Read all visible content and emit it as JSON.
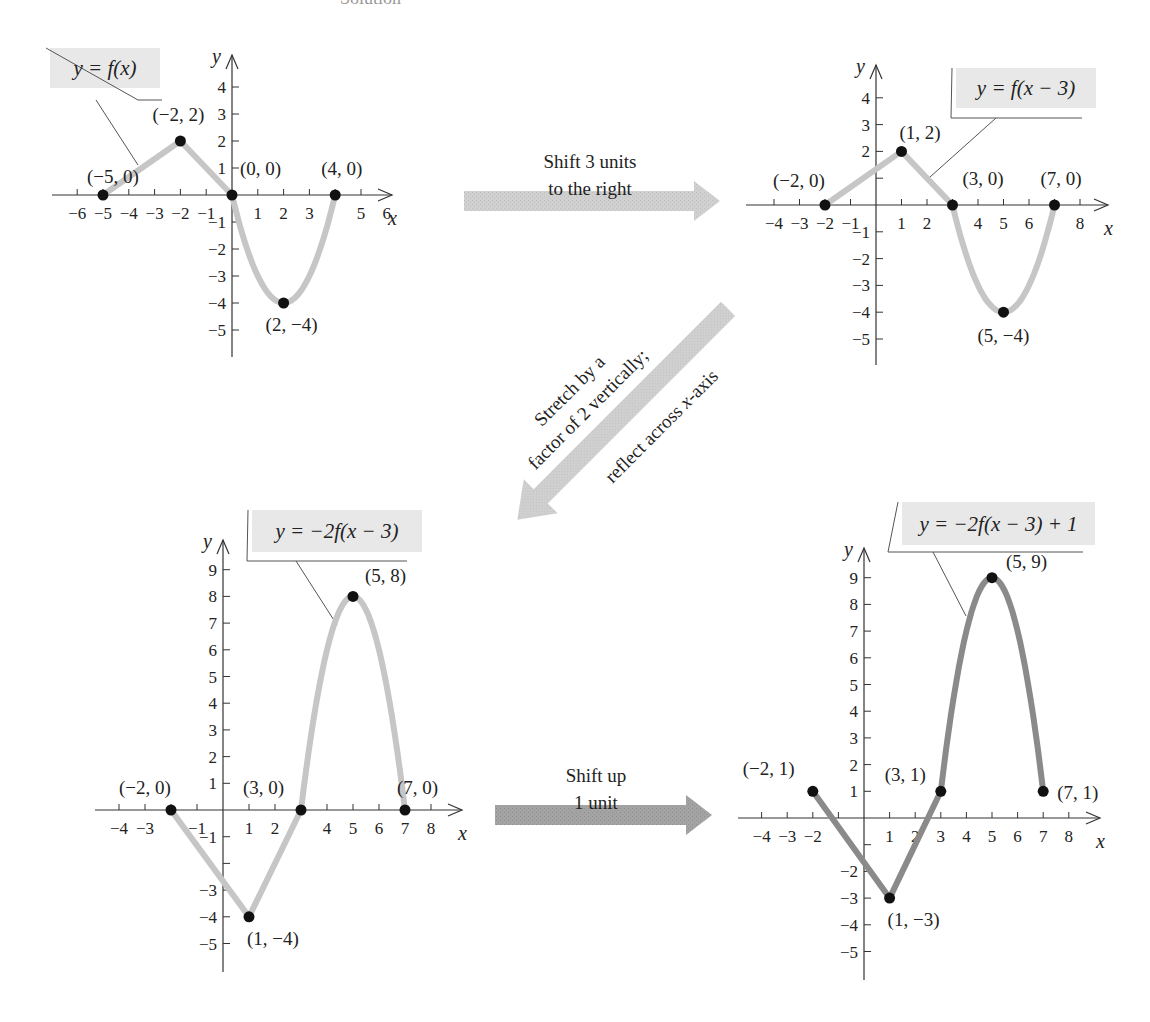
{
  "header_fragment": "Solution",
  "colors": {
    "curve_light": "#c6c6c6",
    "curve_dark": "#8a8a8a",
    "point": "#111111",
    "label_box": "#e8e8e8",
    "arrow_light": "#cfcfcf",
    "arrow_dark": "#9a9a9a"
  },
  "arrows": [
    {
      "id": "shift-right",
      "lines": [
        "Shift 3 units",
        "to the right"
      ]
    },
    {
      "id": "stretch-reflect",
      "lines": [
        "Stretch by a",
        "factor of 2 vertically;",
        "reflect across x-axis"
      ]
    },
    {
      "id": "shift-up",
      "lines": [
        "Shift up",
        "1 unit"
      ]
    }
  ],
  "chart_data": [
    {
      "type": "line",
      "title": "y = f(x)",
      "xlabel": "x",
      "ylabel": "y",
      "xlim": [
        -6.5,
        7
      ],
      "ylim": [
        -6,
        5
      ],
      "x_ticks": [
        "-6",
        "-5",
        "-4",
        "-3",
        "-2",
        "-1",
        "1",
        "2",
        "3",
        "5",
        "6"
      ],
      "y_ticks": [
        "4",
        "3",
        "2",
        "1",
        "-1",
        "-2",
        "-3",
        "-4",
        "-5"
      ],
      "points": [
        {
          "x": -5,
          "y": 0,
          "label": "(−5, 0)"
        },
        {
          "x": -2,
          "y": 2,
          "label": "(−2, 2)"
        },
        {
          "x": 0,
          "y": 0,
          "label": "(0, 0)"
        },
        {
          "x": 2,
          "y": -4,
          "label": "(2, −4)"
        },
        {
          "x": 4,
          "y": 0,
          "label": "(4, 0)"
        }
      ],
      "grid": false
    },
    {
      "type": "line",
      "title": "y = f(x − 3)",
      "xlabel": "x",
      "ylabel": "y",
      "xlim": [
        -5,
        9
      ],
      "ylim": [
        -6,
        5
      ],
      "x_ticks": [
        "-4",
        "-3",
        "-2",
        "-1",
        "1",
        "2",
        "4",
        "5",
        "6",
        "8"
      ],
      "y_ticks": [
        "4",
        "3",
        "2",
        "-1",
        "-2",
        "-3",
        "-4",
        "-5"
      ],
      "points": [
        {
          "x": -2,
          "y": 0,
          "label": "(−2, 0)"
        },
        {
          "x": 1,
          "y": 2,
          "label": "(1, 2)"
        },
        {
          "x": 3,
          "y": 0,
          "label": "(3, 0)"
        },
        {
          "x": 5,
          "y": -4,
          "label": "(5, −4)"
        },
        {
          "x": 7,
          "y": 0,
          "label": "(7, 0)"
        }
      ],
      "grid": false
    },
    {
      "type": "line",
      "title": "y = −2f(x − 3)",
      "xlabel": "x",
      "ylabel": "y",
      "xlim": [
        -5,
        9
      ],
      "ylim": [
        -6,
        10
      ],
      "x_ticks": [
        "-4",
        "-3",
        "-1",
        "1",
        "2",
        "4",
        "5",
        "6",
        "7",
        "8"
      ],
      "y_ticks": [
        "9",
        "8",
        "7",
        "6",
        "5",
        "4",
        "3",
        "2",
        "1",
        "-1",
        "-3",
        "-4",
        "-5"
      ],
      "points": [
        {
          "x": -2,
          "y": 0,
          "label": "(−2, 0)"
        },
        {
          "x": 1,
          "y": -4,
          "label": "(1, −4)"
        },
        {
          "x": 3,
          "y": 0,
          "label": "(3, 0)"
        },
        {
          "x": 5,
          "y": 8,
          "label": "(5, 8)"
        },
        {
          "x": 7,
          "y": 0,
          "label": "(7, 0)"
        }
      ],
      "grid": false
    },
    {
      "type": "line",
      "title": "y = −2f(x − 3) + 1",
      "xlabel": "x",
      "ylabel": "y",
      "xlim": [
        -5,
        9
      ],
      "ylim": [
        -6,
        10
      ],
      "x_ticks": [
        "-4",
        "-3",
        "-2",
        "1",
        "2",
        "3",
        "4",
        "5",
        "6",
        "7",
        "8"
      ],
      "y_ticks": [
        "9",
        "8",
        "7",
        "6",
        "5",
        "4",
        "3",
        "2",
        "1",
        "-2",
        "-3",
        "-4",
        "-5"
      ],
      "points": [
        {
          "x": -2,
          "y": 1,
          "label": "(−2, 1)"
        },
        {
          "x": 1,
          "y": -3,
          "label": "(1, −3)"
        },
        {
          "x": 3,
          "y": 1,
          "label": "(3, 1)"
        },
        {
          "x": 5,
          "y": 9,
          "label": "(5, 9)"
        },
        {
          "x": 7,
          "y": 1,
          "label": "(7, 1)"
        }
      ],
      "grid": false
    }
  ]
}
